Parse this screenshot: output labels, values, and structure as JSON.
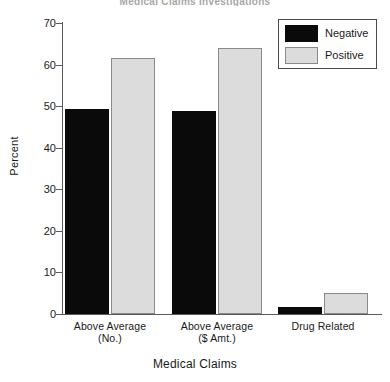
{
  "chart_data": {
    "type": "bar",
    "title": "",
    "xlabel": "Medical Claims",
    "ylabel": "Percent",
    "ylim": [
      0,
      70
    ],
    "ytick_step": 10,
    "yticks": [
      0,
      10,
      20,
      30,
      40,
      50,
      60,
      70
    ],
    "grid": false,
    "legend_position": "top-right",
    "categories": [
      "Above Average\n(No.)",
      "Above Average\n($ Amt.)",
      "Drug Related"
    ],
    "category_lines": [
      [
        "Above Average",
        "(No.)"
      ],
      [
        "Above Average",
        "($ Amt.)"
      ],
      [
        "Drug Related",
        ""
      ]
    ],
    "series": [
      {
        "name": "Negative",
        "color": "#0a0a0a",
        "values": [
          49.2,
          48.8,
          1.6
        ]
      },
      {
        "name": "Positive",
        "color": "#dcdcdc",
        "values": [
          61.5,
          64.0,
          5.0
        ]
      }
    ]
  },
  "legend": {
    "items": [
      {
        "label": "Negative"
      },
      {
        "label": "Positive"
      }
    ]
  },
  "axes": {
    "y_title": "Percent",
    "x_title": "Medical Claims",
    "y_labels": [
      "70",
      "60",
      "50",
      "40",
      "30",
      "20",
      "10",
      "0"
    ]
  },
  "title": {
    "text": "Medical Claims Investigations"
  },
  "colors": {
    "negative": "#0a0a0a",
    "positive": "#dcdcdc",
    "axis": "#5a5a5a",
    "background": "#ffffff"
  }
}
